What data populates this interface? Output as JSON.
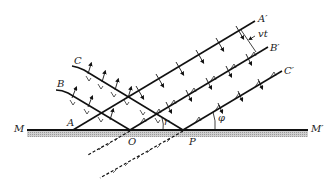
{
  "figure": {
    "labels": {
      "M": "M",
      "M_prime": "M′",
      "A": "A",
      "B": "B",
      "C": "C",
      "O": "O",
      "P": "P",
      "A_prime": "A′",
      "B_prime": "B′",
      "C_prime": "C′",
      "vt": "vt",
      "r": "r",
      "phi": "φ"
    },
    "colors": {
      "line": "#111111",
      "surface_hatch": "#b0b0b0",
      "label": "#222222",
      "background": "#ffffff"
    }
  }
}
